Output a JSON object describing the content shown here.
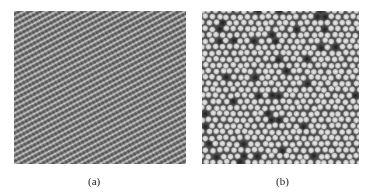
{
  "figure": {
    "panels": [
      {
        "id": "a",
        "label": "(a)",
        "description": "Diagonal stripe lattice pattern (grayscale micrograph)",
        "pattern": "stripes",
        "stripe_period_px": 5,
        "stripe_angle_deg": -28
      },
      {
        "id": "b",
        "label": "(b)",
        "description": "Quasi-hexagonal close-packed dot lattice with dark vacancies (grayscale micrograph)",
        "pattern": "hexagonal-dots",
        "dot_spacing_px": 7
      }
    ],
    "colors": {
      "background": "#ffffff",
      "panel_a_dark": "#5a5a5a",
      "panel_a_light": "#c4c4c4",
      "panel_b_dark": "#3c3c3c",
      "panel_b_light": "#e6e6e6"
    }
  }
}
